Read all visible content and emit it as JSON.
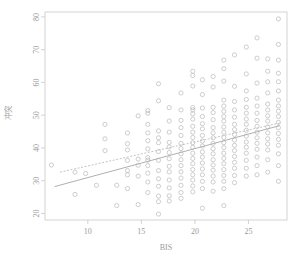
{
  "chart_data": {
    "type": "scatter",
    "title": "",
    "xlabel": "BIS",
    "ylabel": "冲突",
    "xlim": [
      6.0,
      28.6
    ],
    "ylim": [
      18.0,
      81.5
    ],
    "xticks": [
      10,
      15,
      20,
      25
    ],
    "xtick_labels": [
      "10",
      "15",
      "20",
      "25"
    ],
    "yticks": [
      20,
      30,
      40,
      50,
      60,
      70,
      80
    ],
    "ytick_labels": [
      "20",
      "30",
      "40",
      "50",
      "60",
      "70",
      "80"
    ],
    "grid": false,
    "legend": false,
    "marker": "open-circle",
    "marker_color": "#b9b9b9",
    "frame_color": "#c8c8c8",
    "points": [
      [
        6.6,
        34.8
      ],
      [
        8.8,
        32.6
      ],
      [
        8.8,
        25.8
      ],
      [
        9.8,
        32.2
      ],
      [
        10.8,
        28.6
      ],
      [
        11.6,
        47.2
      ],
      [
        11.6,
        42.8
      ],
      [
        11.6,
        39.2
      ],
      [
        12.7,
        28.6
      ],
      [
        12.7,
        22.4
      ],
      [
        13.7,
        44.6
      ],
      [
        13.7,
        41.3
      ],
      [
        13.7,
        39.4
      ],
      [
        13.7,
        36.2
      ],
      [
        13.7,
        33.1
      ],
      [
        13.7,
        31.8
      ],
      [
        13.7,
        27.6
      ],
      [
        14.7,
        49.8
      ],
      [
        14.7,
        36.6
      ],
      [
        14.7,
        34.7
      ],
      [
        14.7,
        31.4
      ],
      [
        14.7,
        22.7
      ],
      [
        15.6,
        51.4
      ],
      [
        15.6,
        50.6
      ],
      [
        15.6,
        47.2
      ],
      [
        15.6,
        44.6
      ],
      [
        15.6,
        42.2
      ],
      [
        15.6,
        39.7
      ],
      [
        15.6,
        37.1
      ],
      [
        15.6,
        36.3
      ],
      [
        15.6,
        34.6
      ],
      [
        15.6,
        32.3
      ],
      [
        15.6,
        29.6
      ],
      [
        15.6,
        26.4
      ],
      [
        16.6,
        59.6
      ],
      [
        16.6,
        54.4
      ],
      [
        16.6,
        45.2
      ],
      [
        16.6,
        43.1
      ],
      [
        16.6,
        41.6
      ],
      [
        16.6,
        38.9
      ],
      [
        16.6,
        36.2
      ],
      [
        16.6,
        33.1
      ],
      [
        16.6,
        30.6
      ],
      [
        16.6,
        28.3
      ],
      [
        16.6,
        25.3
      ],
      [
        16.6,
        23.6
      ],
      [
        16.6,
        19.8
      ],
      [
        17.6,
        52.3
      ],
      [
        17.6,
        48.2
      ],
      [
        17.6,
        44.8
      ],
      [
        17.6,
        41.7
      ],
      [
        17.6,
        40.3
      ],
      [
        17.6,
        38.6
      ],
      [
        17.6,
        36.7
      ],
      [
        17.6,
        34.4
      ],
      [
        17.6,
        32.7
      ],
      [
        17.6,
        30.2
      ],
      [
        17.6,
        27.8
      ],
      [
        17.6,
        25.4
      ],
      [
        17.6,
        23.8
      ],
      [
        18.7,
        56.8
      ],
      [
        18.7,
        51.6
      ],
      [
        18.7,
        48.4
      ],
      [
        18.7,
        46.2
      ],
      [
        18.7,
        43.8
      ],
      [
        18.7,
        41.4
      ],
      [
        18.7,
        39.8
      ],
      [
        18.7,
        38.2
      ],
      [
        18.7,
        36.4
      ],
      [
        18.7,
        34.6
      ],
      [
        18.7,
        32.7
      ],
      [
        18.7,
        30.8
      ],
      [
        18.7,
        28.6
      ],
      [
        18.7,
        26.4
      ],
      [
        18.7,
        24.6
      ],
      [
        19.8,
        63.4
      ],
      [
        19.8,
        62.1
      ],
      [
        19.8,
        58.9
      ],
      [
        19.8,
        52.3
      ],
      [
        19.8,
        51.6
      ],
      [
        19.8,
        50.4
      ],
      [
        19.8,
        48.8
      ],
      [
        19.8,
        46.6
      ],
      [
        19.8,
        44.8
      ],
      [
        19.8,
        43.2
      ],
      [
        19.8,
        41.6
      ],
      [
        19.8,
        40.2
      ],
      [
        19.8,
        38.4
      ],
      [
        19.8,
        36.8
      ],
      [
        19.8,
        35.2
      ],
      [
        19.8,
        33.4
      ],
      [
        19.8,
        31.8
      ],
      [
        19.8,
        30.2
      ],
      [
        19.8,
        28.4
      ],
      [
        19.8,
        26.6
      ],
      [
        20.7,
        60.8
      ],
      [
        20.7,
        56.3
      ],
      [
        20.7,
        52.2
      ],
      [
        20.7,
        49.6
      ],
      [
        20.7,
        47.4
      ],
      [
        20.7,
        45.8
      ],
      [
        20.7,
        43.8
      ],
      [
        20.7,
        42.1
      ],
      [
        20.7,
        40.6
      ],
      [
        20.7,
        38.8
      ],
      [
        20.7,
        37.2
      ],
      [
        20.7,
        35.4
      ],
      [
        20.7,
        33.6
      ],
      [
        20.7,
        31.8
      ],
      [
        20.7,
        29.8
      ],
      [
        20.7,
        27.6
      ],
      [
        20.7,
        21.6
      ],
      [
        21.7,
        61.8
      ],
      [
        21.7,
        58.6
      ],
      [
        21.7,
        52.4
      ],
      [
        21.7,
        50.8
      ],
      [
        21.7,
        48.6
      ],
      [
        21.7,
        46.2
      ],
      [
        21.7,
        44.6
      ],
      [
        21.7,
        43.1
      ],
      [
        21.7,
        41.4
      ],
      [
        21.7,
        39.8
      ],
      [
        21.7,
        38.2
      ],
      [
        21.7,
        36.4
      ],
      [
        21.7,
        34.8
      ],
      [
        21.7,
        33.2
      ],
      [
        21.7,
        31.4
      ],
      [
        21.7,
        29.6
      ],
      [
        21.7,
        26.8
      ],
      [
        22.7,
        66.8
      ],
      [
        22.7,
        64.2
      ],
      [
        22.7,
        60.4
      ],
      [
        22.7,
        54.6
      ],
      [
        22.7,
        52.8
      ],
      [
        22.7,
        51.2
      ],
      [
        22.7,
        49.6
      ],
      [
        22.7,
        48.2
      ],
      [
        22.7,
        46.4
      ],
      [
        22.7,
        44.8
      ],
      [
        22.7,
        43.2
      ],
      [
        22.7,
        41.6
      ],
      [
        22.7,
        40.1
      ],
      [
        22.7,
        38.4
      ],
      [
        22.7,
        36.8
      ],
      [
        22.7,
        35.2
      ],
      [
        22.7,
        33.4
      ],
      [
        22.7,
        31.6
      ],
      [
        22.7,
        29.8
      ],
      [
        22.7,
        27.6
      ],
      [
        22.7,
        22.4
      ],
      [
        23.7,
        68.4
      ],
      [
        23.7,
        58.8
      ],
      [
        23.7,
        54.2
      ],
      [
        23.7,
        51.6
      ],
      [
        23.7,
        49.4
      ],
      [
        23.7,
        47.2
      ],
      [
        23.7,
        45.6
      ],
      [
        23.7,
        44.1
      ],
      [
        23.7,
        42.4
      ],
      [
        23.7,
        40.8
      ],
      [
        23.7,
        39.2
      ],
      [
        23.7,
        37.4
      ],
      [
        23.7,
        35.6
      ],
      [
        23.7,
        33.8
      ],
      [
        23.7,
        31.6
      ],
      [
        23.7,
        29.4
      ],
      [
        24.8,
        70.8
      ],
      [
        24.8,
        62.6
      ],
      [
        24.8,
        57.4
      ],
      [
        24.8,
        54.8
      ],
      [
        24.8,
        52.4
      ],
      [
        24.8,
        50.6
      ],
      [
        24.8,
        48.8
      ],
      [
        24.8,
        47.2
      ],
      [
        24.8,
        45.4
      ],
      [
        24.8,
        43.6
      ],
      [
        24.8,
        41.8
      ],
      [
        24.8,
        40.2
      ],
      [
        24.8,
        38.4
      ],
      [
        24.8,
        36.2
      ],
      [
        24.8,
        33.8
      ],
      [
        24.8,
        31.4
      ],
      [
        25.8,
        73.6
      ],
      [
        25.8,
        67.4
      ],
      [
        25.8,
        59.8
      ],
      [
        25.8,
        55.2
      ],
      [
        25.8,
        52.8
      ],
      [
        25.8,
        50.6
      ],
      [
        25.8,
        48.4
      ],
      [
        25.8,
        46.6
      ],
      [
        25.8,
        44.8
      ],
      [
        25.8,
        43.1
      ],
      [
        25.8,
        41.4
      ],
      [
        25.8,
        39.6
      ],
      [
        25.8,
        37.2
      ],
      [
        25.8,
        34.6
      ],
      [
        25.8,
        31.8
      ],
      [
        26.8,
        67.2
      ],
      [
        26.8,
        63.4
      ],
      [
        26.8,
        60.2
      ],
      [
        26.8,
        56.8
      ],
      [
        26.8,
        53.4
      ],
      [
        26.8,
        51.6
      ],
      [
        26.8,
        49.8
      ],
      [
        26.8,
        48.2
      ],
      [
        26.8,
        46.4
      ],
      [
        26.8,
        44.6
      ],
      [
        26.8,
        42.8
      ],
      [
        26.8,
        41.2
      ],
      [
        26.8,
        39.4
      ],
      [
        26.8,
        36.4
      ],
      [
        26.8,
        32.6
      ],
      [
        27.8,
        79.4
      ],
      [
        27.8,
        71.6
      ],
      [
        27.8,
        66.8
      ],
      [
        27.8,
        62.8
      ],
      [
        27.8,
        60.2
      ],
      [
        27.8,
        57.4
      ],
      [
        27.8,
        54.6
      ],
      [
        27.8,
        52.8
      ],
      [
        27.8,
        51.2
      ],
      [
        27.8,
        49.6
      ],
      [
        27.8,
        47.8
      ],
      [
        27.8,
        46.2
      ],
      [
        27.8,
        44.4
      ],
      [
        27.8,
        42.6
      ],
      [
        27.8,
        40.8
      ],
      [
        27.8,
        38.2
      ],
      [
        27.8,
        34.6
      ],
      [
        27.8,
        29.8
      ]
    ],
    "lines": [
      {
        "name": "regression-solid",
        "style": "solid",
        "color": "#b0b0b0",
        "x0": 6.9,
        "y0": 28.2,
        "x1": 27.9,
        "y1": 46.8
      },
      {
        "name": "regression-dashed",
        "style": "dashed",
        "color": "#c4c4c4",
        "x0": 7.4,
        "y0": 32.6,
        "x1": 27.9,
        "y1": 47.6
      }
    ]
  }
}
